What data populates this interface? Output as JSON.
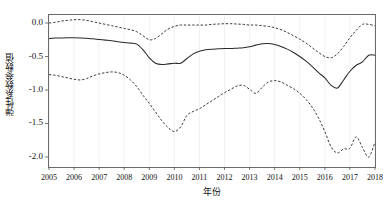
{
  "chart_data": {
    "type": "line",
    "title": "",
    "subtitle": "",
    "xlabel": "年份",
    "ylabel": "弹性系数参数值",
    "xlim": [
      2005,
      2018
    ],
    "ylim": [
      -2.15,
      0.12
    ],
    "grid": "vertical-faint",
    "legend": "none",
    "x_tick_labels": [
      "2005",
      "2006",
      "2007",
      "2008",
      "2009",
      "2010",
      "2011",
      "2012",
      "2013",
      "2014",
      "2015",
      "2016",
      "2017",
      "2018"
    ],
    "x_ticks": [
      2005,
      2006,
      2007,
      2008,
      2009,
      2010,
      2011,
      2012,
      2013,
      2014,
      2015,
      2016,
      2017,
      2018
    ],
    "y_tick_labels": [
      "0.0",
      "-0.5",
      "-1.0",
      "-1.5",
      "-2.0"
    ],
    "y_ticks": [
      0.0,
      -0.5,
      -1.0,
      -1.5,
      -2.0
    ],
    "x": [
      2005.0,
      2005.25,
      2005.5,
      2005.75,
      2006.0,
      2006.25,
      2006.5,
      2006.75,
      2007.0,
      2007.25,
      2007.5,
      2007.75,
      2008.0,
      2008.25,
      2008.5,
      2008.75,
      2009.0,
      2009.25,
      2009.5,
      2009.75,
      2010.0,
      2010.25,
      2010.5,
      2010.75,
      2011.0,
      2011.25,
      2011.5,
      2011.75,
      2012.0,
      2012.25,
      2012.5,
      2012.75,
      2013.0,
      2013.25,
      2013.5,
      2013.75,
      2014.0,
      2014.25,
      2014.5,
      2014.75,
      2015.0,
      2015.25,
      2015.5,
      2015.75,
      2016.0,
      2016.25,
      2016.5,
      2016.75,
      2017.0,
      2017.25,
      2017.5,
      2017.75,
      2018.0
    ],
    "series": [
      {
        "name": "上置信区间",
        "style": "dashed",
        "values": [
          0.0,
          0.01,
          0.03,
          0.04,
          0.05,
          0.05,
          0.04,
          0.02,
          0.0,
          -0.02,
          -0.04,
          -0.06,
          -0.08,
          -0.1,
          -0.13,
          -0.19,
          -0.25,
          -0.23,
          -0.16,
          -0.09,
          -0.05,
          -0.03,
          -0.03,
          -0.03,
          -0.03,
          -0.03,
          -0.02,
          -0.015,
          -0.01,
          -0.01,
          -0.015,
          -0.02,
          -0.03,
          -0.03,
          -0.04,
          -0.05,
          -0.07,
          -0.1,
          -0.14,
          -0.19,
          -0.24,
          -0.3,
          -0.37,
          -0.44,
          -0.5,
          -0.52,
          -0.46,
          -0.35,
          -0.22,
          -0.11,
          -0.02,
          -0.02,
          -0.04
        ]
      },
      {
        "name": "弹性系数估计值",
        "style": "solid",
        "values": [
          -0.23,
          -0.225,
          -0.222,
          -0.22,
          -0.22,
          -0.222,
          -0.228,
          -0.235,
          -0.245,
          -0.255,
          -0.265,
          -0.278,
          -0.29,
          -0.3,
          -0.315,
          -0.4,
          -0.52,
          -0.6,
          -0.62,
          -0.61,
          -0.6,
          -0.6,
          -0.53,
          -0.46,
          -0.42,
          -0.4,
          -0.39,
          -0.385,
          -0.38,
          -0.38,
          -0.375,
          -0.37,
          -0.355,
          -0.33,
          -0.31,
          -0.305,
          -0.32,
          -0.35,
          -0.39,
          -0.44,
          -0.5,
          -0.57,
          -0.65,
          -0.74,
          -0.82,
          -0.93,
          -0.97,
          -0.85,
          -0.72,
          -0.63,
          -0.58,
          -0.48,
          -0.48
        ]
      },
      {
        "name": "下置信区间",
        "style": "dashed",
        "values": [
          -0.77,
          -0.78,
          -0.8,
          -0.82,
          -0.84,
          -0.85,
          -0.83,
          -0.79,
          -0.76,
          -0.74,
          -0.73,
          -0.74,
          -0.78,
          -0.85,
          -0.95,
          -1.08,
          -1.2,
          -1.33,
          -1.46,
          -1.56,
          -1.62,
          -1.55,
          -1.38,
          -1.32,
          -1.28,
          -1.22,
          -1.16,
          -1.1,
          -1.04,
          -0.99,
          -0.94,
          -0.93,
          -0.99,
          -1.05,
          -0.96,
          -0.88,
          -0.86,
          -0.88,
          -0.93,
          -0.98,
          -1.05,
          -1.14,
          -1.26,
          -1.42,
          -1.62,
          -1.85,
          -1.94,
          -1.88,
          -1.87,
          -1.7,
          -1.86,
          -2.0,
          -1.78
        ]
      }
    ],
    "annotations": []
  },
  "axis": {
    "y_title": "弹性系数参数值",
    "x_title": "年份"
  },
  "colors": {
    "frame": "#6b6b6b",
    "solid_line": "#2a2a2a",
    "dashed_line": "#3a3a3a",
    "grid": "#e8e8ec",
    "background": "#ffffff",
    "text": "#111111"
  }
}
